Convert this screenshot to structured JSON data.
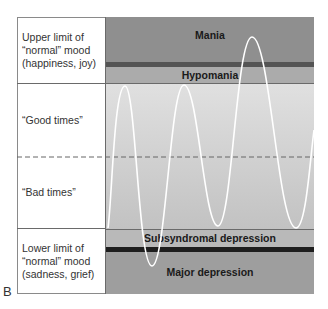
{
  "figure": {
    "panel_letter": "B",
    "row_labels": [
      {
        "id": "upper",
        "line1": "Upper limit of",
        "line2": "“normal” mood",
        "line3": "(happiness, joy)"
      },
      {
        "id": "good",
        "line1": "“Good times”"
      },
      {
        "id": "bad",
        "line1": "“Bad times”"
      },
      {
        "id": "lower",
        "line1": "Lower limit of",
        "line2": "“normal” mood",
        "line3": "(sadness, grief)"
      }
    ],
    "bands": {
      "mania": "Mania",
      "hypomania": "Hypomania",
      "subsyndromal": "Subsyndromal depression",
      "major": "Major depression"
    },
    "colors": {
      "mania": "#8f8f8f",
      "mania_bar": "#545454",
      "hypomania": "#ababab",
      "normal_top": "#dcdcdc",
      "normal_bottom": "#c4c4c4",
      "subsyndromal": "#b9b9b9",
      "depression_bar": "#1e1e1e",
      "major": "#9e9e9e",
      "curve": "#ffffff",
      "dashed": "#666666"
    }
  }
}
